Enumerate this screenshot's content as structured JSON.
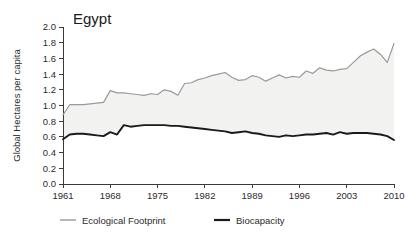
{
  "chart_data": {
    "type": "area",
    "title": "Egypt",
    "xlabel": "",
    "ylabel": "Global Hectares per capita",
    "xlim": [
      1961,
      2010
    ],
    "ylim": [
      0.0,
      2.0
    ],
    "grid": false,
    "legend_position": "bottom",
    "y_ticks": [
      "0.0",
      "0.2",
      "0.4",
      "0.6",
      "0.8",
      "1.0",
      "1.2",
      "1.4",
      "1.6",
      "1.8",
      "2.0"
    ],
    "y_tick_values": [
      0.0,
      0.2,
      0.4,
      0.6,
      0.8,
      1.0,
      1.2,
      1.4,
      1.6,
      1.8,
      2.0
    ],
    "x_ticks": [
      "1961",
      "1968",
      "1975",
      "1982",
      "1989",
      "1996",
      "2003",
      "2010"
    ],
    "x_tick_values": [
      1961,
      1968,
      1975,
      1982,
      1989,
      1996,
      2003,
      2010
    ],
    "x": [
      1961,
      1962,
      1963,
      1964,
      1965,
      1966,
      1967,
      1968,
      1969,
      1970,
      1971,
      1972,
      1973,
      1974,
      1975,
      1976,
      1977,
      1978,
      1979,
      1980,
      1981,
      1982,
      1983,
      1984,
      1985,
      1986,
      1987,
      1988,
      1989,
      1990,
      1991,
      1992,
      1993,
      1994,
      1995,
      1996,
      1997,
      1998,
      1999,
      2000,
      2001,
      2002,
      2003,
      2004,
      2005,
      2006,
      2007,
      2008,
      2009,
      2010
    ],
    "series": [
      {
        "name": "Ecological Footprint",
        "color": "#9a9a9a",
        "values": [
          0.88,
          1.01,
          1.01,
          1.01,
          1.02,
          1.03,
          1.04,
          1.19,
          1.16,
          1.16,
          1.15,
          1.14,
          1.13,
          1.15,
          1.14,
          1.2,
          1.18,
          1.13,
          1.28,
          1.29,
          1.33,
          1.35,
          1.38,
          1.4,
          1.42,
          1.36,
          1.32,
          1.33,
          1.38,
          1.36,
          1.31,
          1.35,
          1.39,
          1.35,
          1.37,
          1.36,
          1.44,
          1.41,
          1.48,
          1.45,
          1.44,
          1.46,
          1.47,
          1.55,
          1.63,
          1.68,
          1.72,
          1.65,
          1.55,
          1.79
        ]
      },
      {
        "name": "Biocapacity",
        "color": "#1a1a1a",
        "values": [
          0.57,
          0.63,
          0.64,
          0.64,
          0.63,
          0.62,
          0.61,
          0.66,
          0.63,
          0.75,
          0.73,
          0.74,
          0.75,
          0.75,
          0.75,
          0.75,
          0.74,
          0.74,
          0.73,
          0.72,
          0.71,
          0.7,
          0.69,
          0.68,
          0.67,
          0.65,
          0.66,
          0.67,
          0.65,
          0.64,
          0.62,
          0.61,
          0.6,
          0.62,
          0.61,
          0.62,
          0.63,
          0.63,
          0.64,
          0.65,
          0.63,
          0.66,
          0.64,
          0.65,
          0.65,
          0.65,
          0.64,
          0.63,
          0.61,
          0.56
        ]
      }
    ],
    "legend": [
      {
        "label": "Ecological Footprint",
        "color": "#9a9a9a"
      },
      {
        "label": "Biocapacity",
        "color": "#1a1a1a"
      }
    ],
    "area_fill_color": "#f2f2f0"
  }
}
